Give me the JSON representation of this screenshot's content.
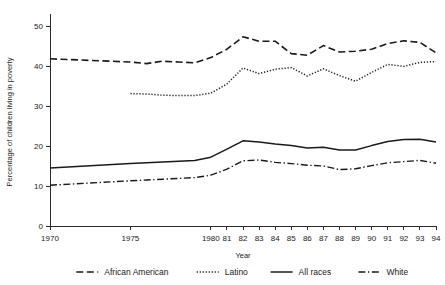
{
  "chart_data": {
    "type": "line",
    "title": "",
    "xlabel": "Year",
    "ylabel": "Percentage of children living in poverty",
    "xlim": [
      1970,
      1994
    ],
    "ylim": [
      0,
      52
    ],
    "yticks": [
      0,
      10,
      20,
      30,
      40,
      50
    ],
    "ytick_labels": [
      "0",
      "10",
      "20",
      "30",
      "40",
      "50"
    ],
    "xticks": [
      1970,
      1975,
      1980,
      1981,
      1982,
      1983,
      1984,
      1985,
      1986,
      1987,
      1988,
      1989,
      1990,
      1991,
      1992,
      1993,
      1994
    ],
    "xtick_labels": [
      "1970",
      "1975",
      "1980",
      "81",
      "82",
      "83",
      "84",
      "85",
      "86",
      "87",
      "88",
      "89",
      "90",
      "91",
      "92",
      "93",
      "94"
    ],
    "grid": false,
    "legend_position": "bottom",
    "series": [
      {
        "name": "African American",
        "style": "dashed",
        "x": [
          1970,
          1975,
          1976,
          1977,
          1978,
          1979,
          1980,
          1981,
          1982,
          1983,
          1984,
          1985,
          1986,
          1987,
          1988,
          1989,
          1990,
          1991,
          1992,
          1993,
          1994
        ],
        "values": [
          41.8,
          41.0,
          40.6,
          41.2,
          41.0,
          40.8,
          42.1,
          44.2,
          47.3,
          46.2,
          46.2,
          43.1,
          42.7,
          45.1,
          43.5,
          43.7,
          44.2,
          45.6,
          46.3,
          45.9,
          43.3
        ]
      },
      {
        "name": "Latino",
        "style": "dotted",
        "x": [
          1975,
          1976,
          1977,
          1978,
          1979,
          1980,
          1981,
          1982,
          1983,
          1984,
          1985,
          1986,
          1987,
          1988,
          1989,
          1990,
          1991,
          1992,
          1993,
          1994
        ],
        "values": [
          33.1,
          33.0,
          32.7,
          32.6,
          32.6,
          33.2,
          35.5,
          39.5,
          38.1,
          39.2,
          39.6,
          37.5,
          39.3,
          37.6,
          36.2,
          38.4,
          40.4,
          39.9,
          40.9,
          41.1
        ]
      },
      {
        "name": "All races",
        "style": "solid",
        "x": [
          1970,
          1975,
          1976,
          1977,
          1978,
          1979,
          1980,
          1981,
          1982,
          1983,
          1984,
          1985,
          1986,
          1987,
          1988,
          1989,
          1990,
          1991,
          1992,
          1993,
          1994
        ],
        "values": [
          14.5,
          15.6,
          15.8,
          16.0,
          16.2,
          16.4,
          17.2,
          19.2,
          21.3,
          21.0,
          20.5,
          20.1,
          19.5,
          19.7,
          19.0,
          19.0,
          20.1,
          21.1,
          21.6,
          21.7,
          21.0
        ]
      },
      {
        "name": "White",
        "style": "dashdot",
        "x": [
          1970,
          1975,
          1976,
          1977,
          1978,
          1979,
          1980,
          1981,
          1982,
          1983,
          1984,
          1985,
          1986,
          1987,
          1988,
          1989,
          1990,
          1991,
          1992,
          1993,
          1994
        ],
        "values": [
          10.2,
          11.3,
          11.5,
          11.7,
          11.9,
          12.1,
          12.7,
          14.2,
          16.3,
          16.5,
          15.9,
          15.6,
          15.2,
          15.0,
          14.1,
          14.3,
          15.1,
          15.8,
          16.1,
          16.4,
          15.7
        ]
      }
    ]
  },
  "legend": {
    "items": [
      {
        "label": "African American",
        "style": "dashed"
      },
      {
        "label": "Latino",
        "style": "dotted"
      },
      {
        "label": "All races",
        "style": "solid"
      },
      {
        "label": "White",
        "style": "dashdot"
      }
    ]
  }
}
